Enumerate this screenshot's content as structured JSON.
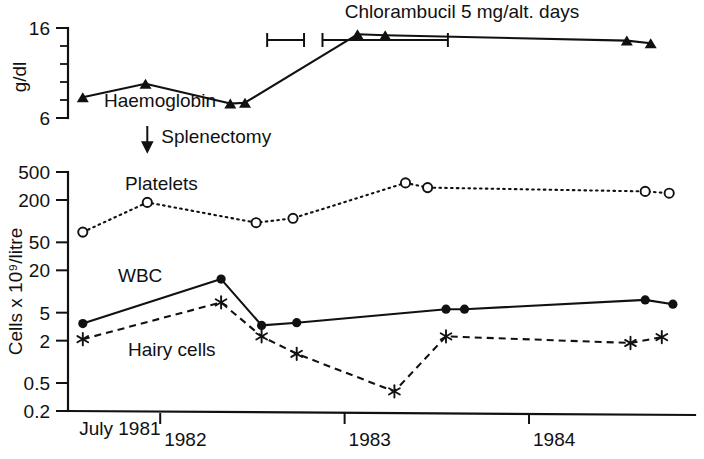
{
  "figure": {
    "annotations": {
      "chlorambucil": "Chlorambucil 5 mg/alt. days",
      "splenectomy": "Splenectomy"
    }
  },
  "chart_data": [
    {
      "type": "line",
      "title": "Haemoglobin",
      "ylabel": "g/dl",
      "xlabel": "",
      "ylim": [
        6,
        16
      ],
      "yticks": [
        6,
        16
      ],
      "ytick_labels": [
        "6",
        "16"
      ],
      "yminor_ticks": [
        8,
        10,
        12,
        14
      ],
      "grid": false,
      "legend": "inline",
      "xlim": [
        1981.5,
        1984.9
      ],
      "series": [
        {
          "name": "Haemoglobin",
          "marker": "triangle",
          "linestyle": "solid",
          "x": [
            1981.58,
            1981.92,
            1982.38,
            1982.46,
            1983.07,
            1983.22,
            1984.53,
            1984.66
          ],
          "values": [
            8.3,
            9.8,
            7.6,
            7.7,
            15.3,
            15.2,
            14.6,
            14.3
          ]
        }
      ],
      "treatment_bars": [
        {
          "label": "Chlorambucil 5 mg/alt. days",
          "start": 1982.58,
          "end": 1982.78
        },
        {
          "label": "Chlorambucil 5 mg/alt. days",
          "start": 1982.88,
          "end": 1983.56
        }
      ],
      "event_marker": {
        "label": "Splenectomy",
        "x": 1981.93
      }
    },
    {
      "type": "line",
      "title": "",
      "ylabel": "Cells x 10⁹/litre",
      "xlabel": "",
      "yscale": "log",
      "ylim": [
        0.2,
        500
      ],
      "yticks": [
        0.2,
        0.5,
        2,
        5,
        20,
        50,
        200,
        500
      ],
      "ytick_labels": [
        "0.2",
        "0.5",
        "2",
        "5",
        "20",
        "50",
        "200",
        "500"
      ],
      "xticks": [
        1981.55,
        1982.0,
        1983.0,
        1984.0
      ],
      "xtick_labels": [
        "July 1981",
        "1982",
        "1983",
        "1984"
      ],
      "xlim": [
        1981.5,
        1984.9
      ],
      "grid": false,
      "legend": "inline",
      "series": [
        {
          "name": "Platelets",
          "marker": "open-circle",
          "linestyle": "dotted",
          "x": [
            1981.58,
            1981.93,
            1982.52,
            1982.72,
            1983.33,
            1983.45,
            1984.63,
            1984.76
          ],
          "values": [
            70,
            185,
            95,
            110,
            350,
            300,
            265,
            250
          ]
        },
        {
          "name": "WBC",
          "marker": "filled-circle",
          "linestyle": "solid",
          "x": [
            1981.58,
            1982.33,
            1982.55,
            1982.74,
            1983.55,
            1983.65,
            1984.63,
            1984.78
          ],
          "values": [
            3.5,
            15.0,
            3.3,
            3.6,
            5.6,
            5.6,
            7.6,
            6.6
          ]
        },
        {
          "name": "Hairy cells",
          "marker": "asterisk",
          "linestyle": "dashed",
          "x": [
            1981.58,
            1982.33,
            1982.55,
            1982.74,
            1983.27,
            1983.55,
            1984.55,
            1984.72
          ],
          "values": [
            2.1,
            7.0,
            2.3,
            1.3,
            0.38,
            2.3,
            1.85,
            2.25
          ]
        }
      ]
    }
  ]
}
